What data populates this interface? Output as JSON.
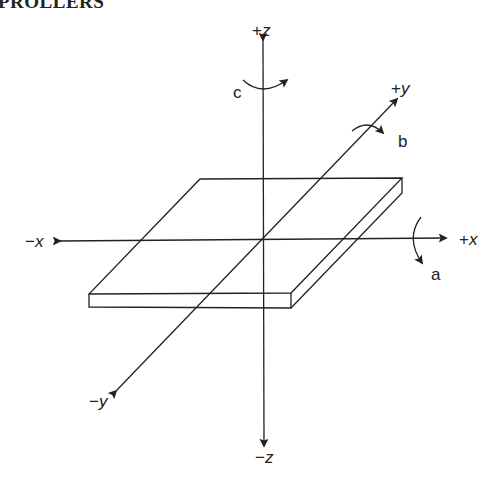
{
  "header": {
    "text": "PROLLERS"
  },
  "diagram": {
    "axes": {
      "plus_x": {
        "sign": "+",
        "var": "x"
      },
      "minus_x": {
        "sign": "−",
        "var": "x"
      },
      "plus_y": {
        "sign": "+",
        "var": "y"
      },
      "minus_y": {
        "sign": "−",
        "var": "y"
      },
      "plus_z": {
        "sign": "+",
        "var": "z"
      },
      "minus_z": {
        "sign": "−",
        "var": "z"
      }
    },
    "rotations": {
      "x": "a",
      "y": "b",
      "z": "c"
    },
    "colors": {
      "line": "#222222",
      "background": "#ffffff"
    }
  }
}
